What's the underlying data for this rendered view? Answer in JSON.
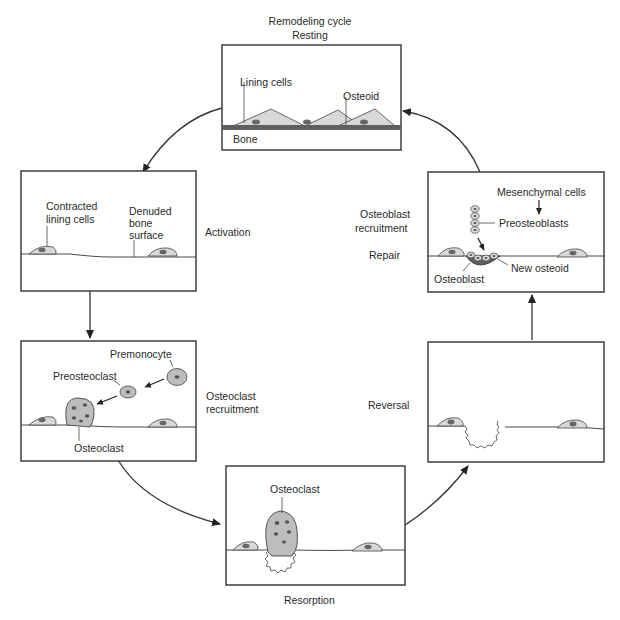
{
  "title": {
    "line1": "Remodeling cycle",
    "line2": "Resting"
  },
  "panels": {
    "resting": {
      "labels": {
        "lining_cells": "Lining cells",
        "osteoid": "Osteoid",
        "bone": "Bone"
      }
    },
    "activation": {
      "stage": "Activation",
      "labels": {
        "contracted_1": "Contracted",
        "contracted_2": "lining cells",
        "denuded_1": "Denuded",
        "denuded_2": "bone",
        "denuded_3": "surface"
      }
    },
    "osteoclast_recruitment": {
      "stage_1": "Osteoclast",
      "stage_2": "recruitment",
      "labels": {
        "premonocyte": "Premonocyte",
        "preosteoclast": "Preosteoclast",
        "osteoclast": "Osteoclast"
      }
    },
    "resorption": {
      "stage": "Resorption",
      "labels": {
        "osteoclast": "Osteoclast"
      }
    },
    "reversal": {
      "stage": "Reversal"
    },
    "osteoblast_recruitment": {
      "stage_1": "Osteoblast",
      "stage_2": "recruitment",
      "stage_3": "Repair",
      "labels": {
        "mesenchymal": "Mesenchymal cells",
        "preosteoblasts": "Preosteoblasts",
        "new_osteoid": "New osteoid",
        "osteoblast": "Osteoblast"
      }
    }
  },
  "colors": {
    "line": "#333333",
    "cell_fill": "#d6d6d6",
    "nucleus": "#6e6e6e",
    "osteoid": "#5a5a5a"
  }
}
